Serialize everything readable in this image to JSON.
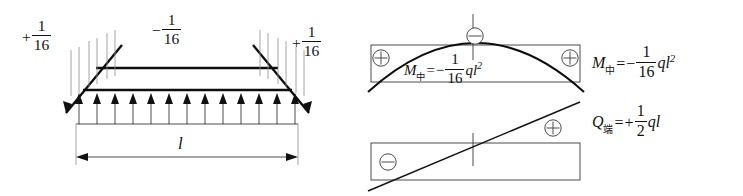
{
  "figure": {
    "type": "structural-beam-diagram",
    "background_color": "#ffffff",
    "line_color": "#111111"
  },
  "beam_panel": {
    "name": "beam-load-panel",
    "left_reaction_label": {
      "sign": "+",
      "numerator": "1",
      "denominator": "16"
    },
    "mid_moment_label": {
      "sign": "−",
      "numerator": "1",
      "denominator": "16"
    },
    "right_reaction_label": {
      "sign": "+",
      "numerator": "1",
      "denominator": "16"
    },
    "span_label": "l",
    "load_arrow_count": 13,
    "load_direction": "up",
    "support_type": "fixed-hatched",
    "supports": [
      "left",
      "right"
    ]
  },
  "moment_panel": {
    "name": "bending-moment-diagram",
    "inner_equation": {
      "symbol": "M",
      "subscript": "中",
      "equals": "=",
      "sign": "−",
      "numerator": "1",
      "denominator": "16",
      "factor": "q",
      "variable": "l",
      "exponent": "2"
    },
    "zone_signs": [
      {
        "label": "⊕",
        "position": "left"
      },
      {
        "label": "⊖",
        "position": "center"
      },
      {
        "label": "⊕",
        "position": "right"
      }
    ],
    "shape": "parabolic-arch"
  },
  "shear_panel": {
    "name": "shear-force-diagram",
    "zone_signs": [
      {
        "label": "⊖",
        "position": "lower-left"
      },
      {
        "label": "⊕",
        "position": "upper-right"
      }
    ],
    "shape": "linear-rising"
  },
  "equations": {
    "moment": {
      "symbol": "M",
      "subscript": "中",
      "equals": "=",
      "sign": "−",
      "numerator": "1",
      "denominator": "16",
      "factor": "q",
      "variable": "l",
      "exponent": "2"
    },
    "shear": {
      "symbol": "Q",
      "subscript": "端",
      "equals": "=",
      "sign": "+",
      "numerator": "1",
      "denominator": "2",
      "factor": "q",
      "variable": "l"
    }
  }
}
